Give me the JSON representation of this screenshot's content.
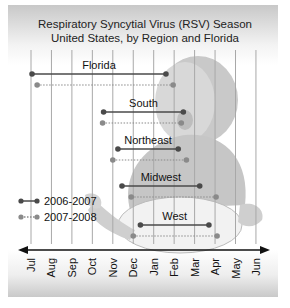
{
  "chart_data": {
    "type": "timeline",
    "title": "Respiratory Syncytial Virus (RSV) Season",
    "subtitle": "United States, by Region and Florida",
    "months": [
      "Jul",
      "Aug",
      "Sep",
      "Oct",
      "Nov",
      "Dec",
      "Jan",
      "Feb",
      "Mar",
      "Apr",
      "May",
      "Jun"
    ],
    "legend": [
      {
        "label": "2006-2007",
        "style": "solid",
        "color": "#4a4a4a"
      },
      {
        "label": "2007-2008",
        "style": "dotted",
        "color": "#8a8a8a"
      }
    ],
    "series": [
      {
        "region": "Florida",
        "2006-2007": {
          "start": 0.05,
          "end": 6.6
        },
        "2007-2008": {
          "start": 0.3,
          "end": 6.95
        }
      },
      {
        "region": "South",
        "2006-2007": {
          "start": 3.55,
          "end": 7.45
        },
        "2007-2008": {
          "start": 3.5,
          "end": 7.35
        }
      },
      {
        "region": "Northeast",
        "2006-2007": {
          "start": 4.25,
          "end": 7.2
        },
        "2007-2008": {
          "start": 4.0,
          "end": 7.6
        }
      },
      {
        "region": "Midwest",
        "2006-2007": {
          "start": 4.45,
          "end": 8.25
        },
        "2007-2008": {
          "start": 4.9,
          "end": 9.05
        }
      },
      {
        "region": "West",
        "2006-2007": {
          "start": 5.35,
          "end": 8.7
        },
        "2007-2008": {
          "start": 5.0,
          "end": 9.1
        }
      }
    ],
    "xlabel": "",
    "ylabel": "",
    "grid": true,
    "legend_position": "left-lower"
  }
}
